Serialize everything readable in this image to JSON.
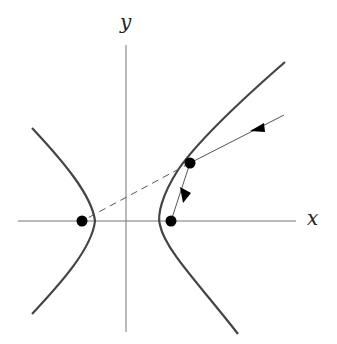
{
  "diagram": {
    "axes": {
      "x_label": "x",
      "y_label": "y"
    },
    "colors": {
      "curve": "#444444",
      "axis": "#777777",
      "ray": "#555555",
      "point": "#000000"
    },
    "points": [
      {
        "name": "left-focus",
        "x": 82,
        "y": 221
      },
      {
        "name": "right-focus",
        "x": 171,
        "y": 221
      },
      {
        "name": "reflection-point",
        "x": 190,
        "y": 163
      }
    ]
  }
}
